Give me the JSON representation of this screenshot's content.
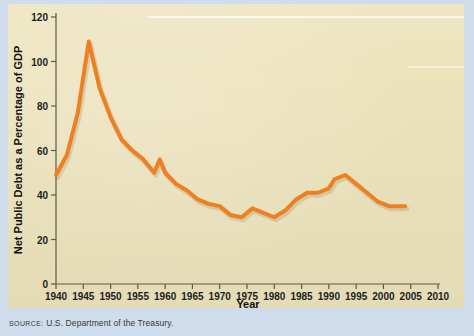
{
  "figure": {
    "panel_bg": "#ece3bd",
    "outer_bg": "#cfdcec",
    "line_color": "#ee8022",
    "axis_color": "#5d5b46"
  },
  "source": {
    "label": "Source:",
    "text": "U.S. Department of the Treasury."
  },
  "chart_data": {
    "type": "line",
    "title": "",
    "xlabel": "Year",
    "ylabel": "Net Public Debt as a Percentage of GDP",
    "xlim": [
      1940,
      2010
    ],
    "ylim": [
      0,
      120
    ],
    "grid": false,
    "legend": "none",
    "xticks": [
      1940,
      1945,
      1950,
      1955,
      1960,
      1965,
      1970,
      1975,
      1980,
      1985,
      1990,
      1995,
      2000,
      2005,
      2010
    ],
    "xtick_labels": [
      "1940",
      "1945",
      "1950",
      "1955",
      "1960",
      "1965",
      "1970",
      "1975",
      "1980",
      "1985",
      "1990",
      "1995",
      "2000",
      "2005",
      "2010"
    ],
    "yticks": [
      0,
      20,
      40,
      60,
      80,
      100,
      120
    ],
    "ytick_labels": [
      "0",
      "20",
      "40",
      "60",
      "80",
      "100",
      "120"
    ],
    "series": [
      {
        "name": "Net public debt as a percentage of GDP",
        "color": "#ee8022",
        "x": [
          1940,
          1942,
          1944,
          1946,
          1948,
          1950,
          1952,
          1954,
          1956,
          1958,
          1959,
          1960,
          1962,
          1964,
          1966,
          1968,
          1970,
          1972,
          1974,
          1976,
          1978,
          1980,
          1982,
          1984,
          1986,
          1988,
          1990,
          1991,
          1993,
          1995,
          1997,
          1999,
          2001,
          2004
        ],
        "y": [
          49,
          58,
          77,
          109,
          88,
          75,
          65,
          60,
          56,
          50,
          56,
          50,
          45,
          42,
          38,
          36,
          35,
          31,
          30,
          34,
          32,
          30,
          33,
          38,
          41,
          41,
          43,
          47,
          49,
          45,
          41,
          37,
          35,
          35
        ]
      }
    ]
  }
}
